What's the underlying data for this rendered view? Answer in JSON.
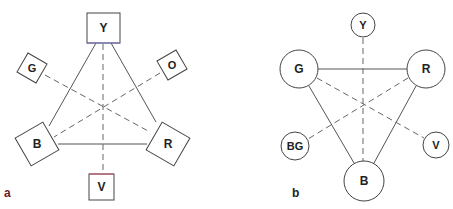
{
  "figure": {
    "panel_a": {
      "label": "a",
      "label_color": "#6b2020",
      "shape": "square",
      "nodes": [
        {
          "id": "Y",
          "label": "Y"
        },
        {
          "id": "G",
          "label": "G"
        },
        {
          "id": "O",
          "label": "O"
        },
        {
          "id": "B",
          "label": "B"
        },
        {
          "id": "R",
          "label": "R"
        },
        {
          "id": "V",
          "label": "V"
        }
      ],
      "solid_edges": [
        [
          "Y",
          "B"
        ],
        [
          "Y",
          "R"
        ],
        [
          "B",
          "R"
        ]
      ],
      "dashed_edges": [
        [
          "Y",
          "V"
        ],
        [
          "G",
          "R"
        ],
        [
          "O",
          "B"
        ]
      ]
    },
    "panel_b": {
      "label": "b",
      "label_color": "#222222",
      "shape": "circle",
      "nodes": [
        {
          "id": "Y",
          "label": "Y"
        },
        {
          "id": "G",
          "label": "G"
        },
        {
          "id": "R",
          "label": "R"
        },
        {
          "id": "BG",
          "label": "BG"
        },
        {
          "id": "V",
          "label": "V"
        },
        {
          "id": "B",
          "label": "B"
        }
      ],
      "solid_edges": [
        [
          "G",
          "R"
        ],
        [
          "G",
          "B"
        ],
        [
          "R",
          "B"
        ]
      ],
      "dashed_edges": [
        [
          "Y",
          "B"
        ],
        [
          "G",
          "V"
        ],
        [
          "R",
          "BG"
        ]
      ]
    }
  }
}
